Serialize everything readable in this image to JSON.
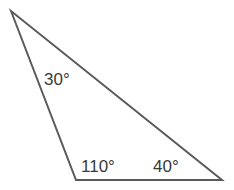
{
  "diagram": {
    "type": "triangle",
    "stroke_color": "#5a5a5a",
    "angles": [
      {
        "vertex": "top",
        "label": "30°"
      },
      {
        "vertex": "bottom-left",
        "label": "110°"
      },
      {
        "vertex": "bottom-right",
        "label": "40°"
      }
    ]
  }
}
